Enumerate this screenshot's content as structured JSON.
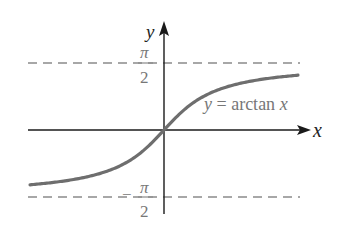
{
  "figure": {
    "curve_label": "y = arctan x",
    "x_axis_label": "x",
    "y_axis_label": "y",
    "upper_asymptote": {
      "numerator": "π",
      "denominator": "2",
      "sign": ""
    },
    "lower_asymptote": {
      "numerator": "π",
      "denominator": "2",
      "sign": "−"
    },
    "colors": {
      "axis": "#1a1a1a",
      "curve": "#6e6e6e",
      "asymptote": "#8a8a8a",
      "text": "#222222",
      "curve_label_text": "#777777"
    }
  },
  "chart_data": {
    "type": "line",
    "title": "y = arctan x",
    "xlabel": "x",
    "ylabel": "y",
    "function": "arctan(x)",
    "x_range": [
      -3.4,
      3.4
    ],
    "ylim": [
      -1.5708,
      1.5708
    ],
    "asymptotes": [
      {
        "y": 1.5708,
        "label": "π/2",
        "style": "dashed"
      },
      {
        "y": -1.5708,
        "label": "-π/2",
        "style": "dashed"
      }
    ],
    "x": [
      -3.4,
      -3,
      -2,
      -1.5,
      -1,
      -0.5,
      0,
      0.5,
      1,
      1.5,
      2,
      3,
      3.4
    ],
    "series": [
      {
        "name": "y = arctan x",
        "values": [
          -1.285,
          -1.249,
          -1.107,
          -0.983,
          -0.785,
          -0.464,
          0,
          0.464,
          0.785,
          0.983,
          1.107,
          1.249,
          1.285
        ]
      }
    ],
    "grid": false,
    "legend": "inline label near curve, right of y-axis"
  }
}
